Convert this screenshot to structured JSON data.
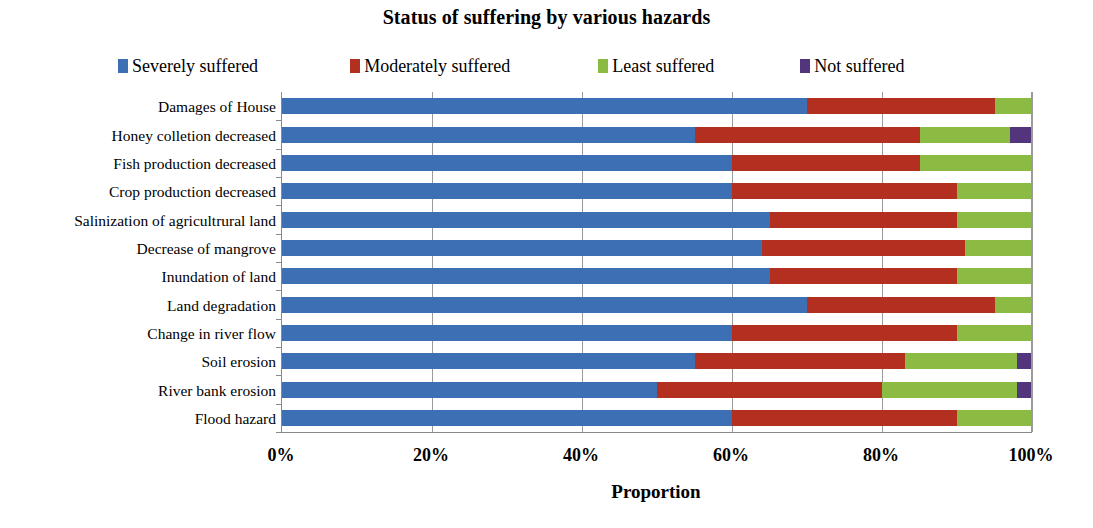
{
  "chart_data": {
    "type": "bar",
    "orientation": "horizontal",
    "stacked": true,
    "stack_mode": "percent",
    "title": "Status of suffering by various hazards",
    "xlabel": "Proportion",
    "ylabel": "",
    "xlim": [
      0,
      100
    ],
    "xticks": [
      0,
      20,
      40,
      60,
      80,
      100
    ],
    "xticklabels": [
      "0%",
      "20%",
      "40%",
      "60%",
      "80%",
      "100%"
    ],
    "grid": "vertical",
    "legend_position": "top",
    "categories": [
      "Damages of House",
      "Honey colletion decreased",
      "Fish production decreased",
      "Crop production decreased",
      "Salinization of agricultrural land",
      "Decrease of mangrove",
      "Inundation of land",
      "Land degradation",
      "Change in river flow",
      "Soil erosion",
      "River bank erosion",
      "Flood hazard"
    ],
    "series": [
      {
        "name": "Severely suffered",
        "color": "#3D6FB5",
        "values": [
          70,
          55,
          60,
          60,
          65,
          64,
          65,
          70,
          60,
          55,
          50,
          60
        ]
      },
      {
        "name": "Moderately suffered",
        "color": "#B33021",
        "values": [
          25,
          30,
          25,
          30,
          25,
          27,
          25,
          25,
          30,
          28,
          30,
          30
        ]
      },
      {
        "name": "Least suffered",
        "color": "#8CBB43",
        "values": [
          5,
          12,
          15,
          10,
          10,
          9,
          10,
          5,
          10,
          15,
          18,
          10
        ]
      },
      {
        "name": "Not suffered",
        "color": "#53357D",
        "values": [
          0,
          3,
          0,
          0,
          0,
          0,
          0,
          0,
          0,
          2,
          2,
          0
        ]
      }
    ]
  },
  "axis_colors": {
    "axis_line": "#8a8a8a",
    "gridline": "#9a9a9a",
    "background": "#ffffff"
  }
}
